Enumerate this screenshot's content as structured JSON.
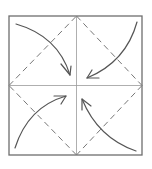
{
  "diagram": {
    "type": "origami-fold-diagram",
    "fold_name": "blintz fold",
    "colors": {
      "background": "#ffffff",
      "paper_outline": "#6e6e6e",
      "crease": "#9a9a9a",
      "valley_fold": "#777777",
      "arrow": "#555555"
    },
    "paper": {
      "x": 9,
      "y": 16,
      "width": 133,
      "height": 139
    },
    "center": {
      "x": 76.5,
      "y": 85.5
    },
    "creases": [
      {
        "id": "vertical-crease",
        "x1": 76.5,
        "y1": 16,
        "x2": 76.5,
        "y2": 155
      },
      {
        "id": "horizontal-crease",
        "x1": 9,
        "y1": 85.5,
        "x2": 142,
        "y2": 85.5
      }
    ],
    "valley_folds": [
      {
        "id": "fold-top-left",
        "x1": 9,
        "y1": 85.5,
        "x2": 76.5,
        "y2": 16
      },
      {
        "id": "fold-top-right",
        "x1": 76.5,
        "y1": 16,
        "x2": 142,
        "y2": 85.5
      },
      {
        "id": "fold-bottom-right",
        "x1": 142,
        "y1": 85.5,
        "x2": 76.5,
        "y2": 155
      },
      {
        "id": "fold-bottom-left",
        "x1": 76.5,
        "y1": 155,
        "x2": 9,
        "y2": 85.5
      }
    ],
    "arrows": [
      {
        "id": "arrow-top-left",
        "from_corner": "top-left",
        "path": "M16 24 Q58 36 70 75",
        "tip": [
          70,
          75
        ],
        "h1": [
          61,
          64
        ],
        "h2": [
          71,
          66
        ]
      },
      {
        "id": "arrow-top-right",
        "from_corner": "top-right",
        "path": "M137 22 Q126 62 87 78",
        "tip": [
          87,
          78
        ],
        "h1": [
          92,
          70
        ],
        "h2": [
          99,
          78
        ]
      },
      {
        "id": "arrow-bottom-left",
        "from_corner": "bottom-left",
        "path": "M15 148 Q28 107 66 96",
        "tip": [
          66,
          96
        ],
        "h1": [
          54,
          96
        ],
        "h2": [
          61,
          104
        ]
      },
      {
        "id": "arrow-bottom-right",
        "from_corner": "bottom-right",
        "path": "M136 151 Q98 138 82 99",
        "tip": [
          82,
          99
        ],
        "h1": [
          82,
          110
        ],
        "h2": [
          91,
          106
        ]
      }
    ]
  }
}
